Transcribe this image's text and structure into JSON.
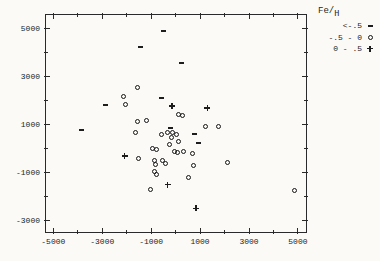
{
  "figure": {
    "background": "#fbfaf7",
    "ink_color": "#1d1d1d"
  },
  "legend": {
    "title_main": "Fe/",
    "title_sub": "H",
    "rows": [
      {
        "label": "<-.5",
        "symbol": "dash"
      },
      {
        "label": "-.5 - 0",
        "symbol": "circle"
      },
      {
        "label": "0 - .5",
        "symbol": "plus"
      }
    ]
  },
  "chart_data": {
    "type": "scatter",
    "title": "",
    "xlabel": "",
    "ylabel": "",
    "legend_title": "Fe/H",
    "legend_position": "top-right-outside",
    "grid": false,
    "xlim": [
      -5300,
      5330
    ],
    "ylim": [
      -3490,
      5580
    ],
    "x_ticks_major": [
      -5000,
      -3000,
      -1000,
      1000,
      3000,
      5000
    ],
    "x_ticks_minor": [
      -4000,
      -2000,
      0,
      2000,
      4000
    ],
    "y_ticks_major": [
      5000,
      3000,
      1000,
      -1000,
      -3000
    ],
    "y_ticks_minor": [
      4000,
      2000,
      0,
      -2000
    ],
    "series": [
      {
        "name": "<-.5",
        "marker": "dash",
        "points": [
          [
            -500,
            4900
          ],
          [
            -1450,
            4250
          ],
          [
            250,
            3590
          ],
          [
            -3830,
            770
          ],
          [
            -2880,
            1820
          ],
          [
            -560,
            2120
          ],
          [
            -220,
            870
          ],
          [
            760,
            620
          ],
          [
            930,
            240
          ]
        ]
      },
      {
        "name": "-.5 - 0",
        "marker": "circle",
        "points": [
          [
            -1560,
            2560
          ],
          [
            -2130,
            2170
          ],
          [
            -2060,
            1860
          ],
          [
            100,
            1440
          ],
          [
            270,
            1380
          ],
          [
            -1200,
            1150
          ],
          [
            -1560,
            1130
          ],
          [
            1230,
            900
          ],
          [
            1750,
            910
          ],
          [
            -1640,
            680
          ],
          [
            -570,
            580
          ],
          [
            -330,
            680
          ],
          [
            -110,
            680
          ],
          [
            50,
            580
          ],
          [
            -160,
            440
          ],
          [
            110,
            280
          ],
          [
            -240,
            150
          ],
          [
            -40,
            -130
          ],
          [
            80,
            -150
          ],
          [
            320,
            -130
          ],
          [
            -930,
            -20
          ],
          [
            -800,
            -50
          ],
          [
            -1530,
            -410
          ],
          [
            -850,
            -510
          ],
          [
            -820,
            -650
          ],
          [
            -550,
            -510
          ],
          [
            -420,
            -620
          ],
          [
            -880,
            -970
          ],
          [
            -780,
            -1080
          ],
          [
            710,
            -210
          ],
          [
            730,
            -690
          ],
          [
            510,
            -1230
          ],
          [
            2130,
            -580
          ],
          [
            -1040,
            -1730
          ],
          [
            4850,
            -1760
          ]
        ]
      },
      {
        "name": "0 - .5",
        "marker": "plus",
        "points": [
          [
            -150,
            1780
          ],
          [
            1300,
            1940
          ],
          [
            -2090,
            190
          ],
          [
            -320,
            -760
          ],
          [
            840,
            -1500
          ]
        ]
      }
    ]
  }
}
